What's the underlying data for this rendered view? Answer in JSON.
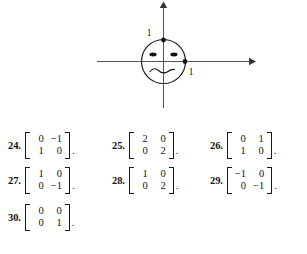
{
  "figure": {
    "name": "smiley-face-unit-square-figure",
    "axis_labels": {
      "y_tick": "1",
      "x_tick": "1"
    },
    "marked_points": [
      {
        "name": "point-0-1",
        "label": "1",
        "axis": "y"
      },
      {
        "name": "point-1-0",
        "label": "1",
        "axis": "x"
      }
    ],
    "face": {
      "eyes": 2,
      "mouth": "wavy"
    }
  },
  "exercises": [
    {
      "number": "24.",
      "matrix": [
        [
          "0",
          "−1"
        ],
        [
          "1",
          "0"
        ]
      ],
      "punctuation": "."
    },
    {
      "number": "25.",
      "matrix": [
        [
          "2",
          "0"
        ],
        [
          "0",
          "2"
        ]
      ],
      "punctuation": "."
    },
    {
      "number": "26.",
      "matrix": [
        [
          "0",
          "1"
        ],
        [
          "1",
          "0"
        ]
      ],
      "punctuation": "."
    },
    {
      "number": "27.",
      "matrix": [
        [
          "1",
          "0"
        ],
        [
          "0",
          "−1"
        ]
      ],
      "punctuation": "."
    },
    {
      "number": "28.",
      "matrix": [
        [
          "1",
          "0"
        ],
        [
          "0",
          "2"
        ]
      ],
      "punctuation": "."
    },
    {
      "number": "29.",
      "matrix": [
        [
          "−1",
          "0"
        ],
        [
          "0",
          "−1"
        ]
      ],
      "punctuation": "."
    },
    {
      "number": "30.",
      "matrix": [
        [
          "0",
          "0"
        ],
        [
          "0",
          "1"
        ]
      ],
      "punctuation": "."
    }
  ]
}
